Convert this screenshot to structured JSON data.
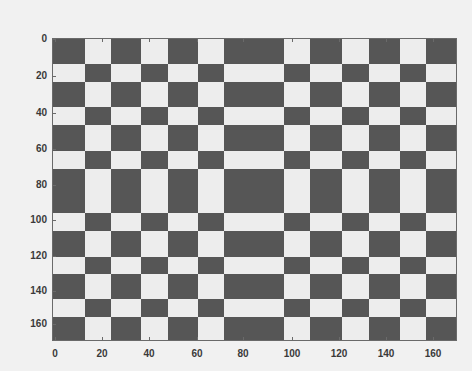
{
  "chart_data": {
    "type": "heatmap",
    "title": "",
    "xlabel": "",
    "ylabel": "",
    "xlim": [
      0,
      168
    ],
    "ylim": [
      169,
      0
    ],
    "grid": false,
    "legend": null,
    "x_ticks": [
      0,
      20,
      40,
      60,
      80,
      100,
      120,
      140,
      160
    ],
    "y_ticks": [
      0,
      20,
      40,
      60,
      80,
      100,
      120,
      140,
      160
    ],
    "col_edges": [
      0,
      13,
      24,
      36,
      48,
      60,
      71,
      96,
      107,
      120,
      132,
      145,
      156,
      168
    ],
    "row_edges": [
      0,
      14,
      24,
      38,
      48,
      63,
      73,
      98,
      108,
      122,
      132,
      146,
      156,
      169
    ],
    "values": [
      [
        1,
        0,
        1,
        0,
        1,
        0,
        1,
        0,
        1,
        0,
        1,
        0,
        1
      ],
      [
        0,
        1,
        0,
        1,
        0,
        1,
        0,
        1,
        0,
        1,
        0,
        1,
        0
      ],
      [
        1,
        0,
        1,
        0,
        1,
        0,
        1,
        0,
        1,
        0,
        1,
        0,
        1
      ],
      [
        0,
        1,
        0,
        1,
        0,
        1,
        0,
        1,
        0,
        1,
        0,
        1,
        0
      ],
      [
        1,
        0,
        1,
        0,
        1,
        0,
        1,
        0,
        1,
        0,
        1,
        0,
        1
      ],
      [
        0,
        1,
        0,
        1,
        0,
        1,
        0,
        1,
        0,
        1,
        0,
        1,
        0
      ],
      [
        1,
        0,
        1,
        0,
        1,
        0,
        1,
        0,
        1,
        0,
        1,
        0,
        1
      ],
      [
        0,
        1,
        0,
        1,
        0,
        1,
        0,
        1,
        0,
        1,
        0,
        1,
        0
      ],
      [
        1,
        0,
        1,
        0,
        1,
        0,
        1,
        0,
        1,
        0,
        1,
        0,
        1
      ],
      [
        0,
        1,
        0,
        1,
        0,
        1,
        0,
        1,
        0,
        1,
        0,
        1,
        0
      ],
      [
        1,
        0,
        1,
        0,
        1,
        0,
        1,
        0,
        1,
        0,
        1,
        0,
        1
      ],
      [
        0,
        1,
        0,
        1,
        0,
        1,
        0,
        1,
        0,
        1,
        0,
        1,
        0
      ],
      [
        1,
        0,
        1,
        0,
        1,
        0,
        1,
        0,
        1,
        0,
        1,
        0,
        1
      ]
    ],
    "value_legend": {
      "1": "dark",
      "0": "light"
    },
    "colors": {
      "dark": "#565656",
      "light": "#ededed",
      "background": "#f1f1f1"
    }
  },
  "layout": {
    "plot_px": {
      "left": 53,
      "top": 39,
      "right": 456,
      "bottom": 340
    },
    "col_px": [
      53,
      85,
      111,
      141,
      168,
      198,
      224,
      284,
      310,
      342,
      369,
      400,
      426,
      456
    ],
    "row_px": [
      39,
      64,
      82,
      107,
      125,
      151,
      169,
      213,
      231,
      257,
      274,
      299,
      317,
      340
    ],
    "x_tick_px": [
      55,
      102,
      149,
      197,
      243,
      292,
      339,
      386,
      433
    ],
    "y_tick_px": [
      39,
      76,
      113,
      149,
      185,
      220,
      256,
      291,
      324
    ]
  }
}
